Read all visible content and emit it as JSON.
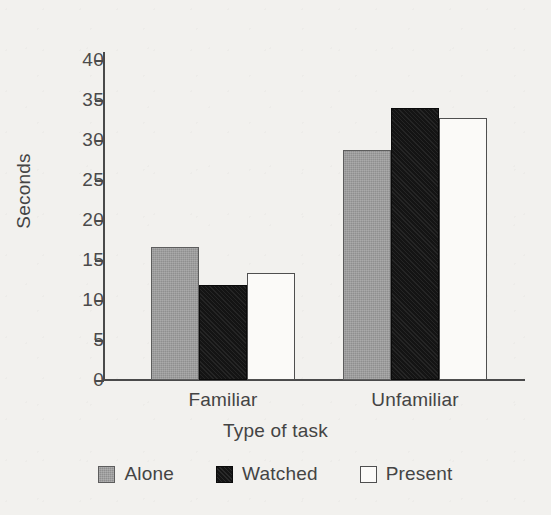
{
  "chart_data": {
    "type": "bar",
    "title": "",
    "subtitle": "",
    "xlabel": "Type of task",
    "ylabel": "Seconds",
    "categories": [
      "Familiar",
      "Unfamiliar"
    ],
    "series": [
      {
        "name": "Alone",
        "values": [
          16.6,
          28.8
        ],
        "color": "#8f8f8f"
      },
      {
        "name": "Watched",
        "values": [
          11.9,
          34.0
        ],
        "color": "#141414"
      },
      {
        "name": "Present",
        "values": [
          13.4,
          32.8
        ],
        "color": "#ffffff"
      }
    ],
    "ylim": [
      0,
      42
    ],
    "yticks": [
      0,
      5,
      10,
      15,
      20,
      25,
      30,
      35,
      40
    ],
    "ytick_labels": [
      "0",
      "5",
      "10",
      "15",
      "20",
      "25",
      "30",
      "35",
      "40"
    ],
    "grid": false,
    "legend_position": "bottom",
    "legend_entries": [
      "Alone",
      "Watched",
      "Present"
    ]
  },
  "axes": {
    "y_title": "Seconds",
    "x_title": "Type of task"
  },
  "colors": {
    "background": "#f2f1ee",
    "axis": "#4a4a4a",
    "text": "#444444",
    "alone_fill": "#8f8f8f",
    "watched_fill": "#141414",
    "present_fill": "#fbfaf8",
    "bar_outline": "#4f4f4f"
  }
}
